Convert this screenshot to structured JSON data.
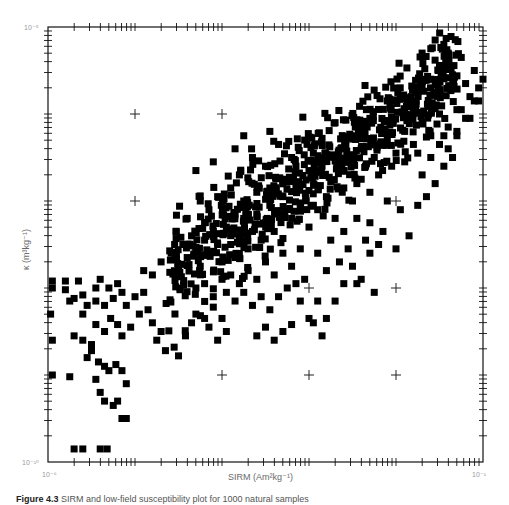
{
  "chart_data": {
    "type": "scatter",
    "title": "",
    "xlabel": "SIRM (Am²kg⁻¹)",
    "ylabel": "κ (m³kg⁻¹)",
    "xscale": "log",
    "yscale": "log",
    "xlim": [
      1e-06,
      0.1
    ],
    "ylim": [
      1e-10,
      1e-05
    ],
    "x_tick_labels": {
      "min": "10⁻⁶",
      "max": "10⁻¹"
    },
    "y_tick_labels": {
      "min": "10⁻¹⁰",
      "max": "10⁻⁵"
    },
    "grid": "crosses at decade intersections",
    "marker": "filled square",
    "marker_color": "#000000",
    "n_points_approx": 1000,
    "note": "Points given as [log10(SIRM), log10(kappa)] estimated from pixel positions",
    "points": [
      [
        -5.95,
        -7.92
      ],
      [
        -5.95,
        -8.0
      ],
      [
        -5.8,
        -7.92
      ],
      [
        -5.8,
        -8.02
      ],
      [
        -5.65,
        -7.92
      ],
      [
        -5.6,
        -8.08
      ],
      [
        -5.45,
        -8.0
      ],
      [
        -5.4,
        -7.9
      ],
      [
        -5.3,
        -8.0
      ],
      [
        -5.2,
        -7.95
      ],
      [
        -5.97,
        -8.3
      ],
      [
        -5.75,
        -8.15
      ],
      [
        -5.6,
        -8.3
      ],
      [
        -5.45,
        -8.15
      ],
      [
        -5.35,
        -8.2
      ],
      [
        -5.25,
        -8.12
      ],
      [
        -5.15,
        -8.05
      ],
      [
        -5.1,
        -8.2
      ],
      [
        -5.0,
        -8.1
      ],
      [
        -4.9,
        -8.05
      ],
      [
        -5.95,
        -8.6
      ],
      [
        -5.7,
        -8.55
      ],
      [
        -5.6,
        -8.6
      ],
      [
        -5.5,
        -8.65
      ],
      [
        -5.45,
        -8.42
      ],
      [
        -5.35,
        -8.5
      ],
      [
        -5.28,
        -8.35
      ],
      [
        -5.2,
        -8.42
      ],
      [
        -5.15,
        -8.55
      ],
      [
        -5.05,
        -8.45
      ],
      [
        -5.55,
        -8.8
      ],
      [
        -5.5,
        -8.72
      ],
      [
        -5.42,
        -8.85
      ],
      [
        -5.35,
        -8.9
      ],
      [
        -5.3,
        -8.95
      ],
      [
        -5.22,
        -8.88
      ],
      [
        -5.15,
        -8.95
      ],
      [
        -5.1,
        -9.1
      ],
      [
        -5.45,
        -9.05
      ],
      [
        -5.4,
        -9.2
      ],
      [
        -5.35,
        -9.3
      ],
      [
        -5.25,
        -9.35
      ],
      [
        -5.2,
        -9.3
      ],
      [
        -5.15,
        -9.5
      ],
      [
        -5.1,
        -9.5
      ],
      [
        -5.75,
        -9.02
      ],
      [
        -5.95,
        -9.0
      ],
      [
        -5.7,
        -9.85
      ],
      [
        -5.6,
        -9.85
      ],
      [
        -5.4,
        -9.85
      ],
      [
        -5.32,
        -9.85
      ],
      [
        -5.7,
        -8.12
      ],
      [
        -5.55,
        -8.2
      ],
      [
        -4.95,
        -8.3
      ],
      [
        -4.85,
        -8.25
      ],
      [
        -4.8,
        -8.4
      ],
      [
        -4.75,
        -8.6
      ],
      [
        -4.7,
        -8.5
      ],
      [
        -4.65,
        -8.72
      ],
      [
        -4.55,
        -8.68
      ],
      [
        -4.5,
        -8.78
      ],
      [
        -4.42,
        -8.55
      ],
      [
        -4.35,
        -8.4
      ],
      [
        -4.3,
        -8.3
      ],
      [
        -4.2,
        -8.35
      ],
      [
        -4.15,
        -8.45
      ],
      [
        -4.1,
        -8.22
      ],
      [
        -4.05,
        -8.6
      ],
      [
        -4.0,
        -8.35
      ],
      [
        -3.95,
        -8.5
      ],
      [
        -4.9,
        -7.8
      ],
      [
        -4.8,
        -7.85
      ],
      [
        -4.7,
        -7.7
      ],
      [
        -4.6,
        -7.82
      ],
      [
        -4.55,
        -7.6
      ],
      [
        -4.5,
        -7.75
      ],
      [
        -4.45,
        -7.5
      ],
      [
        -4.4,
        -7.65
      ],
      [
        -4.35,
        -7.4
      ],
      [
        -4.3,
        -7.55
      ],
      [
        -4.25,
        -7.75
      ],
      [
        -4.2,
        -7.45
      ],
      [
        -4.15,
        -7.6
      ],
      [
        -4.1,
        -7.35
      ],
      [
        -4.05,
        -7.5
      ],
      [
        -4.0,
        -7.7
      ],
      [
        -3.95,
        -7.3
      ],
      [
        -3.9,
        -7.5
      ],
      [
        -3.85,
        -7.65
      ],
      [
        -3.8,
        -7.4
      ],
      [
        -3.75,
        -7.2
      ],
      [
        -3.7,
        -7.55
      ],
      [
        -3.65,
        -7.35
      ],
      [
        -3.6,
        -7.15
      ],
      [
        -3.55,
        -7.45
      ],
      [
        -3.5,
        -7.25
      ],
      [
        -3.45,
        -7.05
      ],
      [
        -3.4,
        -7.35
      ],
      [
        -3.35,
        -7.15
      ],
      [
        -3.3,
        -6.95
      ],
      [
        -4.0,
        -7.9
      ],
      [
        -3.9,
        -7.85
      ],
      [
        -3.8,
        -7.95
      ],
      [
        -3.7,
        -7.8
      ],
      [
        -3.6,
        -7.9
      ],
      [
        -3.5,
        -7.7
      ],
      [
        -3.4,
        -7.85
      ],
      [
        -3.3,
        -7.6
      ],
      [
        -3.2,
        -7.75
      ],
      [
        -3.1,
        -7.55
      ],
      [
        -4.3,
        -8.0
      ],
      [
        -4.2,
        -7.95
      ],
      [
        -4.1,
        -8.1
      ],
      [
        -3.95,
        -8.05
      ],
      [
        -3.85,
        -8.15
      ],
      [
        -3.75,
        -8.05
      ],
      [
        -3.65,
        -8.2
      ],
      [
        -3.55,
        -8.1
      ],
      [
        -3.45,
        -8.25
      ],
      [
        -3.35,
        -8.1
      ],
      [
        -3.25,
        -8.0
      ],
      [
        -3.15,
        -7.95
      ],
      [
        -3.05,
        -7.9
      ],
      [
        -3.1,
        -8.15
      ],
      [
        -3.0,
        -8.35
      ],
      [
        -2.95,
        -8.4
      ],
      [
        -2.9,
        -8.15
      ],
      [
        -2.85,
        -8.55
      ],
      [
        -3.3,
        -8.5
      ],
      [
        -3.2,
        -8.42
      ],
      [
        -3.6,
        -8.55
      ],
      [
        -3.5,
        -8.45
      ],
      [
        -3.4,
        -8.6
      ],
      [
        -2.8,
        -8.35
      ],
      [
        -2.7,
        -8.15
      ],
      [
        -2.6,
        -7.95
      ],
      [
        -2.5,
        -7.75
      ],
      [
        -2.4,
        -7.9
      ],
      [
        -2.3,
        -7.6
      ],
      [
        -2.2,
        -7.5
      ],
      [
        -3.2,
        -7.2
      ],
      [
        -3.1,
        -7.05
      ],
      [
        -3.0,
        -7.3
      ],
      [
        -2.9,
        -7.1
      ],
      [
        -2.8,
        -6.95
      ],
      [
        -2.7,
        -7.2
      ],
      [
        -2.6,
        -6.85
      ],
      [
        -2.5,
        -7.0
      ],
      [
        -2.4,
        -6.75
      ],
      [
        -2.3,
        -6.9
      ],
      [
        -3.3,
        -6.75
      ],
      [
        -3.15,
        -6.85
      ],
      [
        -3.0,
        -6.65
      ],
      [
        -2.85,
        -6.6
      ],
      [
        -2.7,
        -6.5
      ],
      [
        -2.55,
        -6.55
      ],
      [
        -2.4,
        -6.4
      ],
      [
        -2.25,
        -6.5
      ],
      [
        -2.1,
        -6.3
      ],
      [
        -2.0,
        -6.45
      ],
      [
        -1.9,
        -6.2
      ],
      [
        -1.8,
        -6.35
      ],
      [
        -1.7,
        -6.1
      ],
      [
        -1.6,
        -6.25
      ],
      [
        -1.5,
        -6.0
      ],
      [
        -1.4,
        -6.15
      ],
      [
        -1.3,
        -5.95
      ],
      [
        -1.2,
        -6.05
      ],
      [
        -1.1,
        -5.85
      ],
      [
        -1.05,
        -5.7
      ],
      [
        -2.2,
        -6.7
      ],
      [
        -2.05,
        -6.6
      ],
      [
        -1.9,
        -6.55
      ],
      [
        -1.75,
        -6.45
      ],
      [
        -1.6,
        -6.5
      ],
      [
        -1.5,
        -6.35
      ],
      [
        -1.4,
        -6.4
      ],
      [
        -1.3,
        -6.25
      ],
      [
        -1.7,
        -6.7
      ],
      [
        -1.55,
        -6.8
      ],
      [
        -1.45,
        -6.6
      ],
      [
        -1.65,
        -6.95
      ],
      [
        -1.75,
        -7.05
      ],
      [
        -2.1,
        -7.0
      ],
      [
        -1.95,
        -7.1
      ],
      [
        -2.3,
        -7.25
      ],
      [
        -2.15,
        -7.35
      ],
      [
        -2.0,
        -7.55
      ],
      [
        -1.85,
        -7.4
      ],
      [
        -1.45,
        -6.25
      ],
      [
        -3.45,
        -6.2
      ],
      [
        -2.7,
        -6.1
      ],
      [
        -2.5,
        -6.25
      ],
      [
        -2.3,
        -6.05
      ],
      [
        -2.1,
        -5.85
      ],
      [
        -1.9,
        -5.95
      ],
      [
        -1.75,
        -5.75
      ],
      [
        -1.6,
        -5.6
      ],
      [
        -1.5,
        -5.45
      ],
      [
        -1.4,
        -5.3
      ],
      [
        -1.45,
        -5.2
      ],
      [
        -1.35,
        -5.55
      ],
      [
        -1.25,
        -5.35
      ],
      [
        -1.2,
        -5.65
      ],
      [
        -1.1,
        -5.5
      ],
      [
        -1.05,
        -5.85
      ],
      [
        -1.25,
        -5.95
      ],
      [
        -1.15,
        -6.05
      ],
      [
        -1.3,
        -6.2
      ],
      [
        -1.35,
        -6.5
      ],
      [
        -1.15,
        -5.8
      ],
      [
        -1.0,
        -5.6
      ],
      [
        -0.8,
        -5.6
      ],
      [
        -0.88,
        -5.95
      ],
      [
        -0.85,
        -6.55
      ],
      [
        -0.78,
        -5.2
      ],
      [
        -0.72,
        -5.1
      ],
      [
        -0.7,
        -5.65
      ],
      [
        -1.6,
        -5.25
      ],
      [
        -1.55,
        -5.15
      ],
      [
        -1.7,
        -5.3
      ],
      [
        -2.85,
        -6.28
      ],
      [
        -2.95,
        -6.45
      ],
      [
        -3.05,
        -6.3
      ],
      [
        -3.2,
        -6.5
      ],
      [
        -3.35,
        -6.35
      ],
      [
        -3.5,
        -6.6
      ],
      [
        -3.65,
        -6.5
      ],
      [
        -3.8,
        -6.7
      ],
      [
        -3.9,
        -6.85
      ],
      [
        -4.05,
        -6.95
      ],
      [
        -4.15,
        -7.1
      ],
      [
        -4.25,
        -7.0
      ],
      [
        -4.4,
        -7.2
      ],
      [
        -3.6,
        -6.9
      ],
      [
        -3.75,
        -7.0
      ],
      [
        -3.45,
        -6.85
      ],
      [
        -3.85,
        -7.15
      ],
      [
        -2.6,
        -6.65
      ],
      [
        -2.45,
        -6.8
      ],
      [
        -2.35,
        -6.6
      ],
      [
        -2.75,
        -6.78
      ],
      [
        -2.6,
        -7.35
      ],
      [
        -2.45,
        -7.2
      ],
      [
        -2.35,
        -7.45
      ],
      [
        -2.55,
        -7.55
      ],
      [
        -2.75,
        -7.45
      ],
      [
        -2.9,
        -7.6
      ],
      [
        -2.65,
        -7.7
      ],
      [
        -2.8,
        -7.8
      ],
      [
        -0.75,
        -5.05
      ],
      [
        -0.72,
        -5.0
      ],
      [
        -2.45,
        -7.95
      ],
      [
        -2.25,
        -8.05
      ],
      [
        -2.95,
        -7.05
      ],
      [
        -3.15,
        -6.6
      ],
      [
        -3.85,
        -6.4
      ],
      [
        -3.75,
        -6.25
      ],
      [
        -4.1,
        -6.55
      ],
      [
        -4.3,
        -6.65
      ]
    ],
    "reference_crosses": {
      "x_decades": [
        -5,
        -4,
        -3,
        -2
      ],
      "y_decades": [
        -6,
        -7,
        -8,
        -9
      ],
      "missing": [
        [
          -5,
          -8
        ],
        [
          -4,
          -8
        ],
        [
          -4,
          -7
        ],
        [
          -3,
          -7
        ],
        [
          -3,
          -6
        ],
        [
          -2,
          -6
        ],
        [
          -5,
          -9
        ]
      ]
    }
  },
  "axes": {
    "x_min_label": "10⁻⁶",
    "x_max_label": "10⁻¹",
    "y_min_label": "10⁻¹⁰",
    "y_max_label": "10⁻⁵",
    "x_title": "SIRM (Am²kg⁻¹)",
    "y_title": "κ (m³kg⁻¹)"
  },
  "caption": {
    "label": "Figure 4.3",
    "text": "SIRM and low-field susceptibility plot for 1000 natural samples"
  }
}
